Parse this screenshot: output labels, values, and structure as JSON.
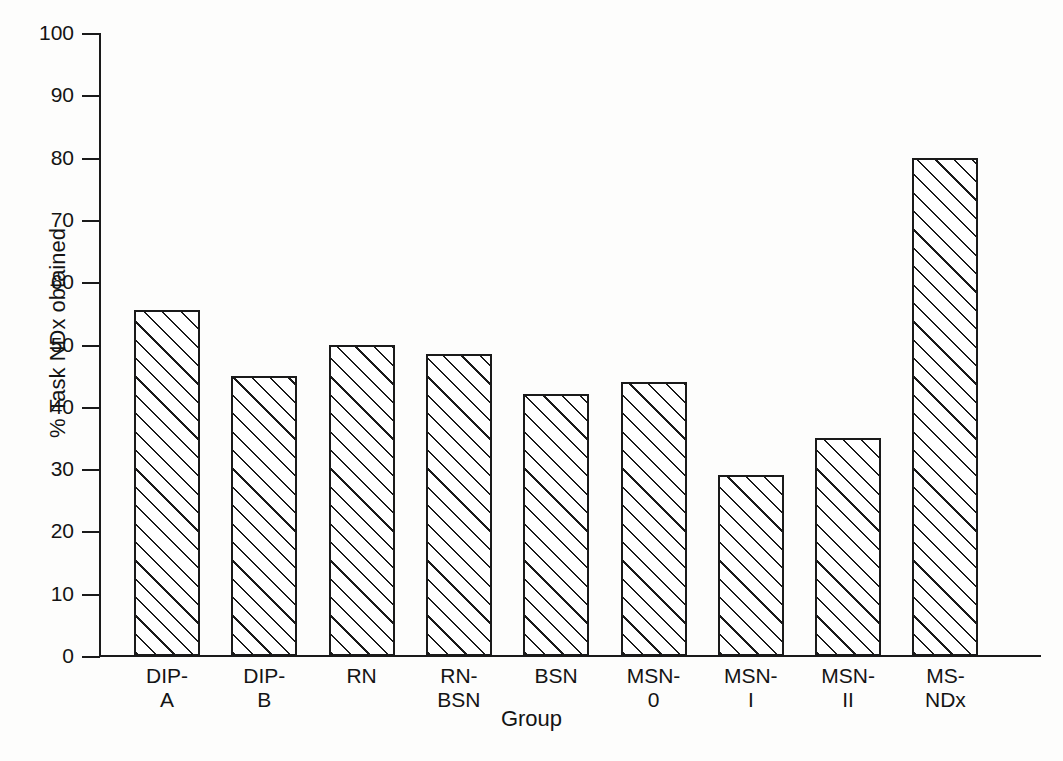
{
  "chart_data": {
    "type": "bar",
    "title": "",
    "xlabel": "Group",
    "ylabel": "% Task NDx obtained",
    "categories": [
      "DIP-\nA",
      "DIP-\nB",
      "RN",
      "RN-\nBSN",
      "BSN",
      "MSN-\n0",
      "MSN-\nI",
      "MSN-\nII",
      "MS-\nNDx"
    ],
    "values": [
      55.5,
      45,
      50,
      48.5,
      42,
      44,
      29,
      35,
      80
    ],
    "ylim": [
      0,
      100
    ],
    "yticks": [
      0,
      10,
      20,
      30,
      40,
      50,
      60,
      70,
      80,
      90,
      100
    ],
    "ytick_labels": [
      "0",
      "10",
      "20",
      "30",
      "40",
      "50",
      "60",
      "70",
      "80",
      "90",
      "100"
    ],
    "grid": false,
    "legend": false,
    "bar_style": {
      "fill": "#ffffff",
      "edge_color": "#1a1a1a",
      "hatch": "diagonal-forward-slash"
    }
  }
}
